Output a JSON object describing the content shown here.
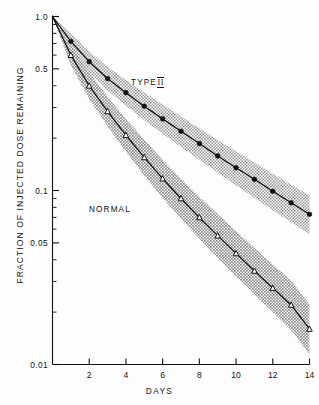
{
  "figure": {
    "ylabel": "FRACTION OF INJECTED DOSE REMAINING",
    "xlabel": "DAYS",
    "annotations": [
      {
        "name": "type-ii-label",
        "text": "TYPE",
        "roman": "II",
        "x": 131,
        "y": 78
      },
      {
        "name": "normal-label",
        "text": "NORMAL",
        "x": 89,
        "y": 205
      }
    ]
  },
  "chart_data": {
    "type": "line",
    "title": "",
    "xlabel": "DAYS",
    "ylabel": "FRACTION OF INJECTED DOSE REMAINING",
    "yscale": "log",
    "xlim": [
      0,
      14
    ],
    "ylim": [
      0.01,
      1.0
    ],
    "grid": false,
    "legend": "inline-annotation",
    "ytick_labels": [
      "1.0",
      "0.5",
      "0.1",
      "0.05",
      "0.01"
    ],
    "ytick_values": [
      1.0,
      0.5,
      0.1,
      0.05,
      0.01
    ],
    "xtick_labels": [
      "2",
      "4",
      "6",
      "8",
      "10",
      "12",
      "14"
    ],
    "xtick_values": [
      2,
      4,
      6,
      8,
      10,
      12,
      14
    ],
    "x": [
      0,
      1,
      2,
      3,
      4,
      5,
      6,
      7,
      8,
      9,
      10,
      11,
      12,
      13,
      14
    ],
    "series": [
      {
        "name": "TYPE II",
        "marker": "filled-circle",
        "values": [
          1.0,
          0.72,
          0.55,
          0.44,
          0.365,
          0.305,
          0.258,
          0.219,
          0.186,
          0.158,
          0.135,
          0.116,
          0.099,
          0.085,
          0.073
        ],
        "band_upper": [
          1.0,
          0.8,
          0.63,
          0.515,
          0.432,
          0.366,
          0.312,
          0.266,
          0.228,
          0.195,
          0.168,
          0.145,
          0.125,
          0.108,
          0.094
        ],
        "band_lower": [
          1.0,
          0.645,
          0.478,
          0.375,
          0.307,
          0.253,
          0.212,
          0.178,
          0.15,
          0.127,
          0.107,
          0.091,
          0.077,
          0.066,
          0.056
        ]
      },
      {
        "name": "NORMAL",
        "marker": "open-triangle",
        "values": [
          1.0,
          0.6,
          0.4,
          0.285,
          0.208,
          0.155,
          0.117,
          0.09,
          0.07,
          0.055,
          0.0435,
          0.0345,
          0.0275,
          0.022,
          0.016
        ],
        "band_upper": [
          1.0,
          0.685,
          0.475,
          0.347,
          0.258,
          0.196,
          0.15,
          0.117,
          0.092,
          0.073,
          0.0585,
          0.0468,
          0.0376,
          0.0303,
          0.0222
        ],
        "band_lower": [
          1.0,
          0.525,
          0.337,
          0.234,
          0.167,
          0.122,
          0.0905,
          0.0688,
          0.0528,
          0.041,
          0.0322,
          0.0253,
          0.02,
          0.0158,
          0.0114
        ]
      }
    ]
  }
}
